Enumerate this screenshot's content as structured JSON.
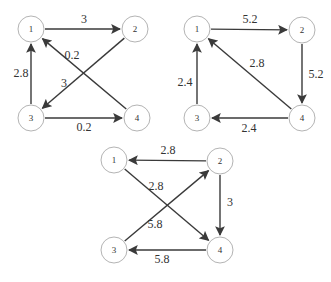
{
  "colors": {
    "edge": "#3a3a3a",
    "node_stroke": "#b4b4b4",
    "text": "#333333"
  },
  "graphs": [
    {
      "name": "graph-top-left",
      "nodes": [
        {
          "id": "1",
          "x": 31,
          "y": 29
        },
        {
          "id": "2",
          "x": 135,
          "y": 29
        },
        {
          "id": "3",
          "x": 31,
          "y": 118
        },
        {
          "id": "4",
          "x": 137,
          "y": 118
        }
      ],
      "edges": [
        {
          "from": "1",
          "to": "2",
          "weight": "3",
          "lx": 84,
          "ly": 19
        },
        {
          "from": "2",
          "to": "3",
          "weight": "3",
          "lx": 64,
          "ly": 83
        },
        {
          "from": "4",
          "to": "1",
          "weight": "0.2",
          "lx": 72,
          "ly": 55
        },
        {
          "from": "3",
          "to": "1",
          "weight": "2.8",
          "lx": 21,
          "ly": 73
        },
        {
          "from": "3",
          "to": "4",
          "weight": "0.2",
          "lx": 84,
          "ly": 127
        }
      ]
    },
    {
      "name": "graph-top-right",
      "nodes": [
        {
          "id": "1",
          "x": 197,
          "y": 29
        },
        {
          "id": "2",
          "x": 302,
          "y": 30
        },
        {
          "id": "3",
          "x": 197,
          "y": 118
        },
        {
          "id": "4",
          "x": 302,
          "y": 118
        }
      ],
      "edges": [
        {
          "from": "1",
          "to": "2",
          "weight": "5.2",
          "lx": 250,
          "ly": 19
        },
        {
          "from": "2",
          "to": "4",
          "weight": "5.2",
          "lx": 316,
          "ly": 74
        },
        {
          "from": "4",
          "to": "1",
          "weight": "2.8",
          "lx": 257,
          "ly": 63
        },
        {
          "from": "3",
          "to": "1",
          "weight": "2.4",
          "lx": 185,
          "ly": 82
        },
        {
          "from": "4",
          "to": "3",
          "weight": "2.4",
          "lx": 249,
          "ly": 128
        }
      ]
    },
    {
      "name": "graph-bottom",
      "nodes": [
        {
          "id": "1",
          "x": 114,
          "y": 160
        },
        {
          "id": "2",
          "x": 220,
          "y": 161
        },
        {
          "id": "3",
          "x": 114,
          "y": 250
        },
        {
          "id": "4",
          "x": 220,
          "y": 250
        }
      ],
      "edges": [
        {
          "from": "2",
          "to": "1",
          "weight": "2.8",
          "lx": 168,
          "ly": 150
        },
        {
          "from": "1",
          "to": "4",
          "weight": "2.8",
          "lx": 156,
          "ly": 186
        },
        {
          "from": "3",
          "to": "2",
          "weight": "5.8",
          "lx": 155,
          "ly": 224
        },
        {
          "from": "2",
          "to": "4",
          "weight": "3",
          "lx": 230,
          "ly": 202
        },
        {
          "from": "4",
          "to": "3",
          "weight": "5.8",
          "lx": 162,
          "ly": 259
        }
      ]
    }
  ]
}
